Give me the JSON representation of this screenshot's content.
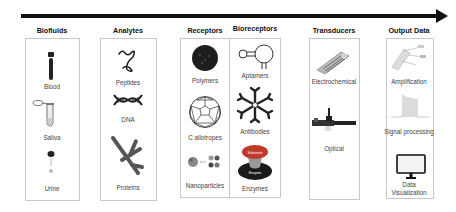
{
  "title_arrow": "process-flow-arrow",
  "columns": [
    {
      "title": "Biofluids",
      "items": [
        "Blood",
        "Saliva",
        "Urine"
      ]
    },
    {
      "title": "Analytes",
      "items": [
        "Peptides",
        "DNA",
        "Proteins"
      ]
    },
    {
      "title": "Receptors",
      "items": [
        "Polymers",
        "C allotropes",
        "Nanoparticles"
      ]
    },
    {
      "title": "Bioreceptors",
      "items": [
        "Aptamers",
        "Antibodies",
        "Enzymes"
      ]
    },
    {
      "title": "Transducers",
      "items": [
        "Electrochemical",
        "Optical"
      ]
    },
    {
      "title": "Output Data",
      "items": [
        "Amplification",
        "Signal processing",
        "Data Visualization"
      ]
    }
  ],
  "enzyme_icon_text": {
    "substrate": "Substrate",
    "enzyme": "Enzyme"
  },
  "colors": {
    "arrow": "#111111",
    "box_border": "#c8c8c8",
    "enzyme_top": "#c0392b",
    "enzyme_bottom": "#1a1a1a"
  }
}
